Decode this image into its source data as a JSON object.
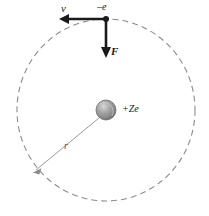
{
  "figure": {
    "background_color": "#ffffff",
    "labels": {
      "velocity": "v",
      "electron_charge": "–e",
      "force": "F",
      "nucleus_charge": "+Ze",
      "radius": "r"
    },
    "colors": {
      "orbit_dash": "#8c8c8c",
      "arrow_dark": "#1a1a1a",
      "radius_line": "#999999",
      "nucleus_light": "#c9c9c9",
      "nucleus_mid": "#9a9a9a",
      "nucleus_dark": "#6e6e6e",
      "text": "#1a1a1a"
    },
    "orbit": {
      "center_x": 106,
      "center_y": 110,
      "radius_x": 89,
      "radius_y": 91,
      "style": "dashed",
      "dash_pattern": "6 4"
    },
    "nucleus": {
      "center_x": 106,
      "center_y": 110,
      "radius": 10,
      "charge_label": "+Ze"
    },
    "electron": {
      "x": 106,
      "y": 19,
      "charge_label": "–e",
      "dot_radius": 3
    },
    "velocity_arrow": {
      "from_x": 106,
      "from_y": 19,
      "to_x": 60,
      "to_y": 19,
      "direction": "left",
      "label": "v"
    },
    "force_arrow": {
      "from_x": 106,
      "from_y": 19,
      "to_x": 106,
      "to_y": 58,
      "direction": "down",
      "label": "F"
    },
    "radius_arrow": {
      "from_x": 99,
      "from_y": 118,
      "to_x": 33,
      "to_y": 172,
      "label": "r"
    }
  }
}
